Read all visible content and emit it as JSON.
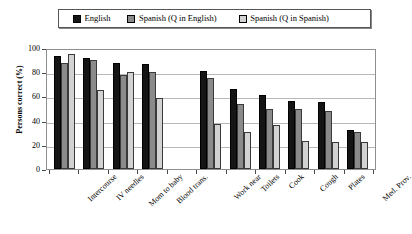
{
  "legend": {
    "items": [
      {
        "label": "English",
        "color": "#151515",
        "name": "english"
      },
      {
        "label": "Spanish (Q in English)",
        "color": "#8b8b8b",
        "name": "spanish-q-english"
      },
      {
        "label": "Spanish (Q in Spanish)",
        "color": "#d2d2d2",
        "name": "spanish-q-spanish"
      }
    ]
  },
  "axis": {
    "ylabel": "Persons correct (%)",
    "yticks": [
      "0",
      "20",
      "40",
      "60",
      "80",
      "100"
    ]
  },
  "chart_data": {
    "type": "bar",
    "title": "",
    "xlabel": "",
    "ylabel": "Persons correct (%)",
    "ylim": [
      0,
      100
    ],
    "ytick_step": 20,
    "grid": true,
    "legend_position": "top",
    "categories": [
      "Intercourse",
      "IV needles",
      "Mom to baby",
      "Blood trans.",
      "",
      "Work near",
      "Toilets",
      "Cook",
      "Cough",
      "Plates",
      "Med. Prov."
    ],
    "series": [
      {
        "name": "English",
        "color": "#151515",
        "values": [
          93,
          92,
          88,
          87,
          null,
          81,
          66,
          61,
          56,
          55,
          32
        ]
      },
      {
        "name": "Spanish (Q in English)",
        "color": "#8b8b8b",
        "values": [
          88,
          90,
          78,
          80,
          null,
          75,
          54,
          50,
          50,
          48,
          31
        ]
      },
      {
        "name": "Spanish (Q in Spanish)",
        "color": "#d2d2d2",
        "values": [
          95,
          65,
          80,
          59,
          null,
          37,
          31,
          36,
          23,
          22,
          22
        ]
      }
    ]
  }
}
